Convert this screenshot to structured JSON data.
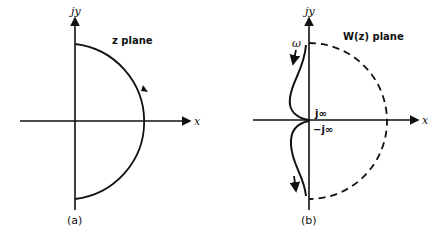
{
  "panels": [
    {
      "id": "a",
      "caption": "(a)",
      "plane_label": "z plane",
      "y_axis_label": "jy",
      "x_axis_label": "x",
      "contour": "solid semicircle in right half-plane with clockwise direction arrow"
    },
    {
      "id": "b",
      "caption": "(b)",
      "plane_label": "W(z) plane",
      "y_axis_label": "jy",
      "x_axis_label": "x",
      "omega_label": "ω",
      "pos_j_inf_label": "j∞",
      "neg_j_inf_label": "−j∞",
      "contour": "dashed semicircle mapped image with solid frequency locus along imaginary axis"
    }
  ],
  "colors": {
    "ink": "#111111",
    "background": "#ffffff"
  }
}
